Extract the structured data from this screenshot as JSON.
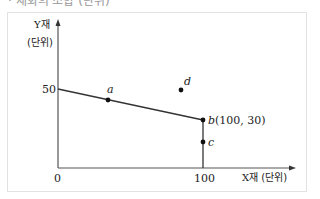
{
  "header": {
    "cutoff_text": "· 재화의 조합 (단위)"
  },
  "diagram": {
    "y_axis_label": "Y재",
    "y_axis_unit": "(단위)",
    "x_axis_label": "X재",
    "x_axis_unit": "(단위)",
    "origin_label": "0",
    "y_tick": "50",
    "x_tick": "100",
    "points": [
      {
        "name": "a",
        "label": "a"
      },
      {
        "name": "b",
        "label": "b",
        "coords": "(100, 30)"
      },
      {
        "name": "c",
        "label": "c"
      },
      {
        "name": "d",
        "label": "d"
      }
    ],
    "colors": {
      "axis": "#555555",
      "line": "#333333",
      "point": "#111111",
      "frame": "#e2e2e2"
    }
  }
}
